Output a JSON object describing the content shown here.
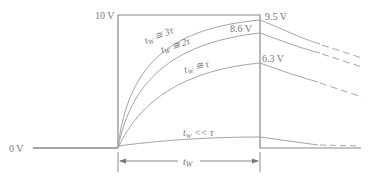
{
  "diagram": {
    "colors": {
      "line": "#9a9a9a",
      "pulse": "#8a8a8a",
      "text": "#777777",
      "background": "#ffffff"
    },
    "levels": {
      "high": "10 V",
      "low": "0 V"
    },
    "curves": [
      {
        "label": "t_W ≅ 3τ",
        "text_main": "t",
        "sub": "W",
        "rel": " ≅ 3τ",
        "final_value": "9.5 V"
      },
      {
        "label": "t_W ≅ 2τ",
        "text_main": "t",
        "sub": "W",
        "rel": " ≅ 2τ",
        "final_value": "8.6 V"
      },
      {
        "label": "t_W ≅ τ",
        "text_main": "t",
        "sub": "W",
        "rel": " ≅ τ",
        "final_value": "6.3 V"
      },
      {
        "label": "t_W << τ",
        "text_main": "t",
        "sub": "W",
        "rel": " << τ",
        "final_value": ""
      }
    ],
    "width_marker": {
      "text_main": "t",
      "sub": "W"
    }
  }
}
